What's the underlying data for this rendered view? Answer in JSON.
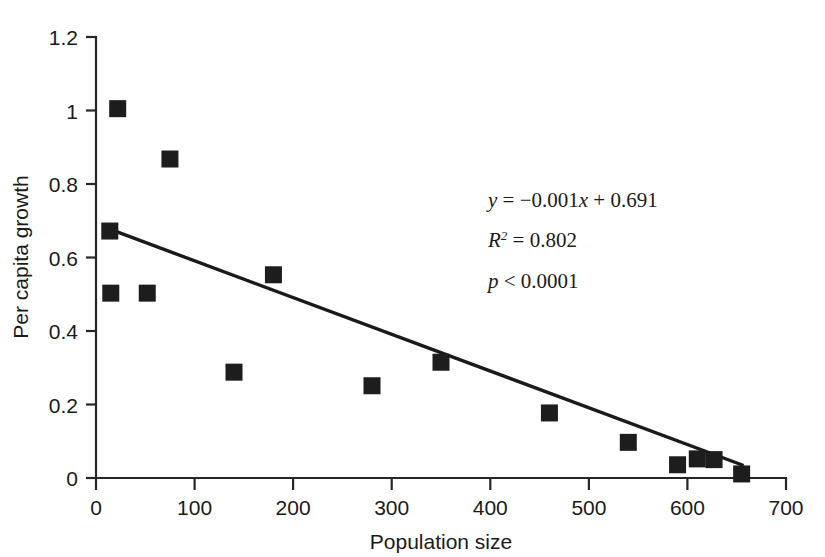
{
  "chart_data": {
    "type": "scatter",
    "title": "",
    "xlabel": "Population size",
    "ylabel": "Per capita growth",
    "xlim": [
      0,
      700
    ],
    "ylim": [
      0,
      1.2
    ],
    "grid": false,
    "legend": "none",
    "x_ticks": [
      "0",
      "100",
      "200",
      "300",
      "400",
      "500",
      "600",
      "700"
    ],
    "x_tick_values": [
      0,
      100,
      200,
      300,
      400,
      500,
      600,
      700
    ],
    "y_ticks": [
      "0",
      "0.2",
      "0.4",
      "0.6",
      "0.8",
      "1",
      "1.2"
    ],
    "y_tick_values": [
      0,
      0.2,
      0.4,
      0.6,
      0.8,
      1.0,
      1.2
    ],
    "marker_style": "filled-square",
    "marker_color": "#1d1d1d",
    "points": [
      {
        "x": 14,
        "y": 0.672
      },
      {
        "x": 15,
        "y": 0.503
      },
      {
        "x": 22,
        "y": 1.005
      },
      {
        "x": 52,
        "y": 0.503
      },
      {
        "x": 75,
        "y": 0.868
      },
      {
        "x": 140,
        "y": 0.288
      },
      {
        "x": 180,
        "y": 0.553
      },
      {
        "x": 280,
        "y": 0.251
      },
      {
        "x": 350,
        "y": 0.315
      },
      {
        "x": 460,
        "y": 0.177
      },
      {
        "x": 540,
        "y": 0.097
      },
      {
        "x": 590,
        "y": 0.036
      },
      {
        "x": 610,
        "y": 0.052
      },
      {
        "x": 627,
        "y": 0.05
      },
      {
        "x": 655,
        "y": 0.011
      }
    ],
    "trend_line": {
      "slope": -0.001,
      "intercept": 0.691,
      "x_start": 14,
      "x_end": 657,
      "y_start": 0.677,
      "y_end": 0.034
    },
    "annotations": {
      "equation": "y = −0.001x + 0.691",
      "equation_parts": {
        "y": "y",
        "rest": " = −0.001",
        "x": "x",
        "tail": " + 0.691"
      },
      "r_squared_symbol": "R",
      "r_squared_exp": "2",
      "r_squared_value": " = 0.802",
      "p_symbol": "p",
      "p_value": " < 0.0001"
    }
  },
  "colors": {
    "axis": "#262626",
    "marker": "#1d1d1d",
    "line": "#1a1a1a",
    "text": "#1a1a1a",
    "background": "#ffffff"
  }
}
